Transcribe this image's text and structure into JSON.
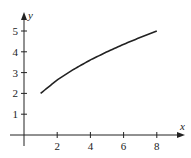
{
  "chart_data": {
    "type": "line",
    "title": "",
    "xlabel": "x",
    "ylabel": "y",
    "xlim": [
      -0.5,
      9.5
    ],
    "ylim": [
      -0.6,
      6
    ],
    "grid": false,
    "legend": null,
    "x_ticks": [
      2,
      4,
      6,
      8
    ],
    "y_ticks": [
      1,
      2,
      3,
      4,
      5
    ],
    "x_tick_labels": [
      "2",
      "4",
      "6",
      "8"
    ],
    "y_tick_labels": [
      "1",
      "2",
      "3",
      "4",
      "5"
    ],
    "series": [
      {
        "name": "curve",
        "x": [
          1,
          2,
          3,
          4,
          5,
          6,
          7,
          8
        ],
        "y": [
          2.0,
          2.65,
          3.16,
          3.61,
          4.0,
          4.36,
          4.69,
          5.0
        ]
      }
    ]
  },
  "axes": {
    "x_label": "x",
    "y_label": "y"
  }
}
